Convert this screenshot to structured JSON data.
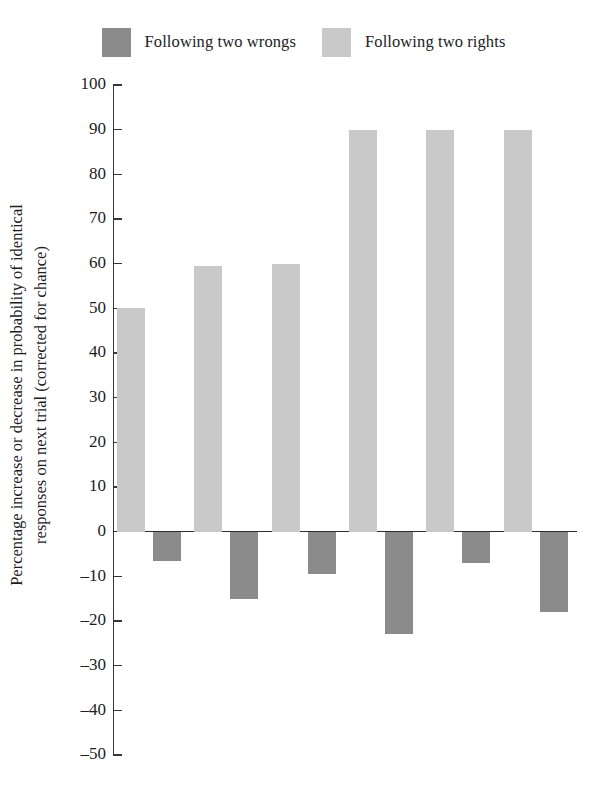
{
  "chart_data": {
    "type": "bar",
    "title": "",
    "subtitle": "",
    "xlabel": "",
    "ylabel": "Percentage increase or decrease in probability of identical responses on next trial (corrected for chance)",
    "ylabel_lines": [
      "Percentage increase or decrease in probability of identical",
      "responses on next trial (corrected for chance)"
    ],
    "ylim": [
      -50,
      100
    ],
    "ytick_labels": [
      "100",
      "90",
      "80",
      "70",
      "60",
      "50",
      "40",
      "30",
      "20",
      "10",
      "0",
      "–10",
      "–20",
      "–30",
      "–40",
      "–50"
    ],
    "ytick_values": [
      100,
      90,
      80,
      70,
      60,
      50,
      40,
      30,
      20,
      10,
      0,
      -10,
      -20,
      -30,
      -40,
      -50
    ],
    "grid": false,
    "legend_position": "top-center",
    "categories": [
      "1",
      "2",
      "3",
      "4",
      "5",
      "6"
    ],
    "xtick_labels": [],
    "series": [
      {
        "name": "Following two rights",
        "color": "#c9c9c9",
        "values": [
          50,
          59.5,
          60,
          90,
          90,
          90
        ]
      },
      {
        "name": "Following two wrongs",
        "color": "#8b8b8b",
        "values": [
          -6.5,
          -15,
          -9.5,
          -23,
          -7,
          -18
        ]
      }
    ]
  },
  "legend": {
    "entries": [
      {
        "label": "Following two wrongs",
        "color": "#8b8b8b"
      },
      {
        "label": "Following two rights",
        "color": "#c9c9c9"
      }
    ]
  },
  "axis": {
    "ticks": [
      {
        "label": "100",
        "value": 100
      },
      {
        "label": "90",
        "value": 90
      },
      {
        "label": "80",
        "value": 80
      },
      {
        "label": "70",
        "value": 70
      },
      {
        "label": "60",
        "value": 60
      },
      {
        "label": "50",
        "value": 50
      },
      {
        "label": "40",
        "value": 40
      },
      {
        "label": "30",
        "value": 30
      },
      {
        "label": "20",
        "value": 20
      },
      {
        "label": "10",
        "value": 10
      },
      {
        "label": "0",
        "value": 0
      },
      {
        "label": "–10",
        "value": -10
      },
      {
        "label": "–20",
        "value": -20
      },
      {
        "label": "–30",
        "value": -30
      },
      {
        "label": "–40",
        "value": -40
      },
      {
        "label": "–50",
        "value": -50
      }
    ],
    "title_line1": "Percentage increase or decrease in probability of identical",
    "title_line2": "responses on next trial (corrected for chance)"
  },
  "colors": {
    "light_bar": "#c9c9c9",
    "dark_bar": "#8b8b8b",
    "axis": "#3a3637",
    "text": "#211d1e",
    "background": "#ffffff"
  },
  "layout": {
    "plot_top_value": 100,
    "plot_bottom_value": -50,
    "plot_height_px": 670,
    "plot_width_px": 464,
    "group_slot_px": 77.3,
    "bar_width_px": 28,
    "light_bar_offset_px": 4,
    "dark_bar_offset_px": 40
  }
}
